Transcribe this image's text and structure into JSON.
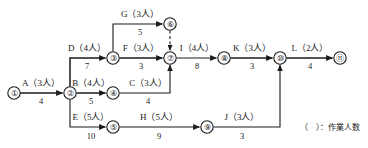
{
  "diagram": {
    "type": "arrow-diagram-network",
    "legend": "（　）：作業人数",
    "nodes": [
      {
        "id": "1",
        "label": "①",
        "x": 14,
        "y": 93
      },
      {
        "id": "2",
        "label": "②",
        "x": 70,
        "y": 93
      },
      {
        "id": "3",
        "label": "③",
        "x": 113,
        "y": 58
      },
      {
        "id": "4",
        "label": "④",
        "x": 113,
        "y": 93
      },
      {
        "id": "5",
        "label": "⑤",
        "x": 113,
        "y": 127
      },
      {
        "id": "6",
        "label": "⑥",
        "x": 170,
        "y": 24
      },
      {
        "id": "7",
        "label": "⑦",
        "x": 170,
        "y": 58
      },
      {
        "id": "8",
        "label": "⑧",
        "x": 224,
        "y": 58
      },
      {
        "id": "9",
        "label": "⑨",
        "x": 207,
        "y": 127
      },
      {
        "id": "10",
        "label": "⑩",
        "x": 280,
        "y": 58
      },
      {
        "id": "11",
        "label": "⑪",
        "x": 340,
        "y": 58
      }
    ],
    "activities": [
      {
        "name": "A",
        "workers": "3",
        "label": "A（3人）",
        "duration": "4",
        "from": "1",
        "to": "2"
      },
      {
        "name": "B",
        "workers": "4",
        "label": "B（4人）",
        "duration": "5",
        "from": "2",
        "to": "4"
      },
      {
        "name": "C",
        "workers": "3",
        "label": "C（3人）",
        "duration": "4",
        "from": "4",
        "to": "7"
      },
      {
        "name": "D",
        "workers": "4",
        "label": "D（4人）",
        "duration": "7",
        "from": "2",
        "to": "3"
      },
      {
        "name": "E",
        "workers": "5",
        "label": "E（5人）",
        "duration": "10",
        "from": "2",
        "to": "5"
      },
      {
        "name": "F",
        "workers": "3",
        "label": "F（3人）",
        "duration": "3",
        "from": "3",
        "to": "7"
      },
      {
        "name": "G",
        "workers": "3",
        "label": "G（3人）",
        "duration": "5",
        "from": "3",
        "to": "6"
      },
      {
        "name": "H",
        "workers": "5",
        "label": "H（5人）",
        "duration": "9",
        "from": "5",
        "to": "9"
      },
      {
        "name": "I",
        "workers": "4",
        "label": "I（4人）",
        "duration": "8",
        "from": "7",
        "to": "8"
      },
      {
        "name": "J",
        "workers": "3",
        "label": "J（3人）",
        "duration": "3",
        "from": "9",
        "to": "10"
      },
      {
        "name": "K",
        "workers": "3",
        "label": "K（3人）",
        "duration": "3",
        "from": "8",
        "to": "10"
      },
      {
        "name": "L",
        "workers": "2",
        "label": "L（2人）",
        "duration": "4",
        "from": "10",
        "to": "11"
      }
    ],
    "dummy": {
      "from": "6",
      "to": "7",
      "style": "dashed"
    },
    "colors": {
      "line": "#1a1a1a",
      "background": "#ffffff"
    }
  }
}
